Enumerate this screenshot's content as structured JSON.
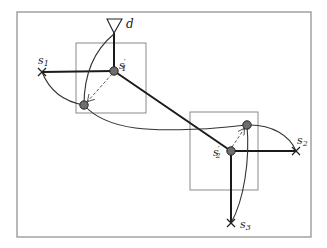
{
  "diagram": {
    "type": "network-topology",
    "colors": {
      "frame": "#8a8a8a",
      "box": "#8a8a8a",
      "edge": "#1a1a1a",
      "curve": "#333333",
      "dashed": "#555555",
      "node_fill": "#6e6e6e"
    },
    "labels": {
      "destination": "d",
      "s1": "s",
      "s1_sub": "1",
      "s1_prime": "s",
      "s1_prime_sub": "1",
      "s1_prime_mark": "′",
      "s2": "s",
      "s2_sub": "2",
      "s2_prime": "s",
      "s2_prime_sub": "2",
      "s2_prime_mark": "′",
      "s3": "s",
      "s3_sub": "3"
    },
    "nodes": [
      {
        "id": "d",
        "kind": "sink-triangle",
        "x": 114,
        "y": 26
      },
      {
        "id": "s1",
        "kind": "source-cross",
        "x": 42,
        "y": 72
      },
      {
        "id": "s1_prime",
        "kind": "relay-dot",
        "x": 114,
        "y": 71
      },
      {
        "id": "r1",
        "kind": "relay-dot",
        "x": 84,
        "y": 105
      },
      {
        "id": "s2_prime",
        "kind": "relay-dot",
        "x": 231,
        "y": 151
      },
      {
        "id": "r2",
        "kind": "relay-dot",
        "x": 247,
        "y": 125
      },
      {
        "id": "s2",
        "kind": "source-cross",
        "x": 296,
        "y": 151
      },
      {
        "id": "s3",
        "kind": "source-cross",
        "x": 231,
        "y": 223
      }
    ],
    "boxes": [
      {
        "id": "region-1",
        "x": 76,
        "y": 43,
        "w": 70,
        "h": 70
      },
      {
        "id": "region-2",
        "x": 190,
        "y": 112,
        "w": 68,
        "h": 78
      }
    ]
  }
}
